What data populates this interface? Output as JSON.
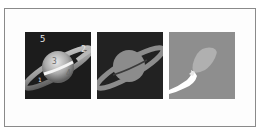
{
  "figure": {
    "panels": [
      {
        "id": "original",
        "description": "grayscale Saturn image with numbered region labels",
        "labels": [
          "5",
          "2",
          "3",
          "4",
          "1"
        ]
      },
      {
        "id": "segmented",
        "description": "flat gray segmentation of planet and ring on dark background"
      },
      {
        "id": "region-mask",
        "description": "light gray blob and white streak on gray background"
      }
    ],
    "colors": {
      "frame_border": "#8a8a8a",
      "panel1_bg": "#1c1c1c",
      "panel2_bg": "#222222",
      "panel3_bg": "#8e8e8e",
      "segment_gray": "#8c8c8c",
      "blob_gray": "#b0b0b0",
      "streak_white": "#ffffff"
    }
  }
}
